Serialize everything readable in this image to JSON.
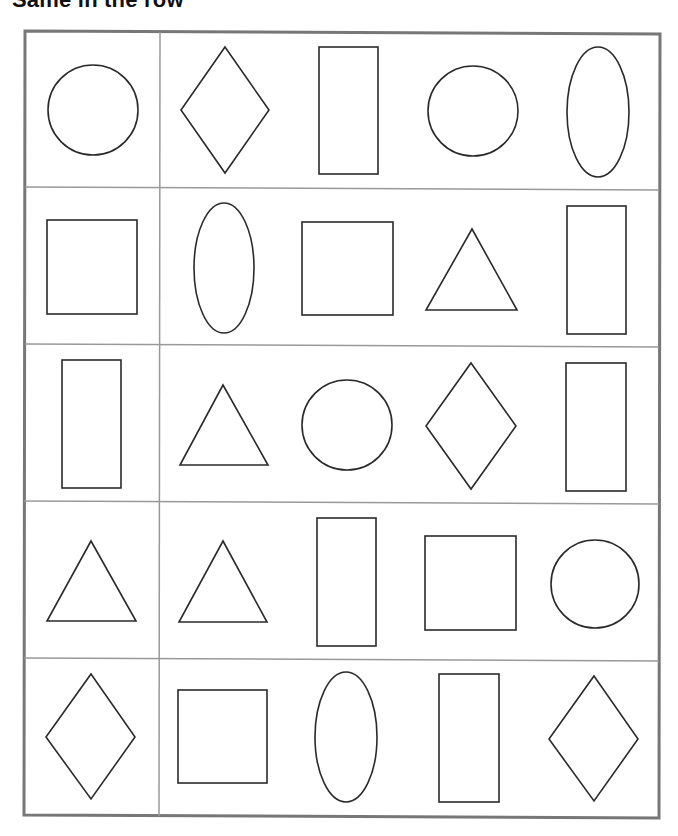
{
  "worksheet": {
    "title": "Same in the row",
    "colors": {
      "outer_border": "#777777",
      "grid_line": "#999999",
      "shape_stroke": "#2a2a2a",
      "background": "#ffffff"
    },
    "grid": {
      "rows": 5,
      "columns": 2,
      "layout": "first column holds one reference shape; second column holds four comparison shapes"
    },
    "rows": [
      {
        "reference": "circle",
        "shapes": [
          "diamond",
          "rectangle",
          "circle",
          "ellipse"
        ]
      },
      {
        "reference": "square",
        "shapes": [
          "ellipse",
          "square",
          "triangle",
          "rectangle"
        ]
      },
      {
        "reference": "rectangle",
        "shapes": [
          "triangle",
          "circle",
          "diamond",
          "rectangle"
        ]
      },
      {
        "reference": "triangle",
        "shapes": [
          "triangle",
          "rectangle",
          "square",
          "circle"
        ]
      },
      {
        "reference": "diamond",
        "shapes": [
          "square",
          "ellipse",
          "rectangle",
          "diamond"
        ]
      }
    ]
  }
}
